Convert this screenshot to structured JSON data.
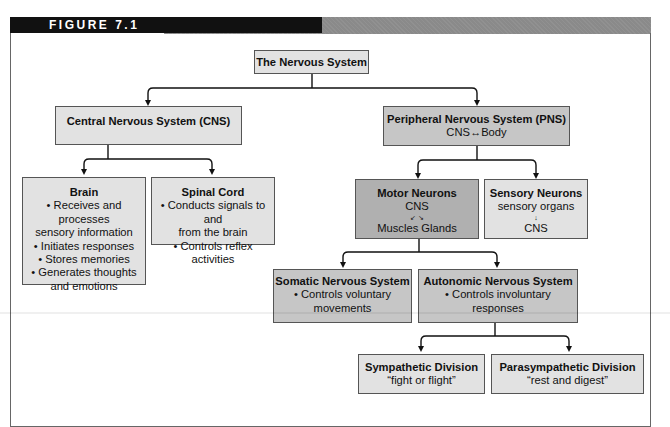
{
  "figure": {
    "label": "FIGURE 7.1"
  },
  "nodes": {
    "root": {
      "title": "The Nervous System"
    },
    "cns": {
      "title": "Central Nervous System (CNS)"
    },
    "pns": {
      "title": "Peripheral Nervous System (PNS)",
      "subtitle": "CNS↔Body"
    },
    "brain": {
      "title": "Brain",
      "lines": [
        "• Receives and processes",
        "sensory information",
        "• Initiates responses",
        "• Stores memories",
        "• Generates thoughts",
        "and emotions"
      ]
    },
    "spinal": {
      "title": "Spinal Cord",
      "lines": [
        "• Conducts signals to and",
        "from the brain",
        "• Controls reflex activities"
      ]
    },
    "motor": {
      "title": "Motor Neurons",
      "lines": [
        "CNS",
        "↙ ↘",
        "Muscles Glands"
      ]
    },
    "sensory": {
      "title": "Sensory Neurons",
      "lines": [
        "sensory organs",
        "↓",
        "CNS"
      ]
    },
    "somatic": {
      "title": "Somatic Nervous System",
      "lines": [
        "• Controls voluntary",
        "movements"
      ]
    },
    "autonomic": {
      "title": "Autonomic Nervous System",
      "lines": [
        "• Controls involuntary responses"
      ]
    },
    "sympathetic": {
      "title": "Sympathetic Division",
      "lines": [
        "“fight or flight”"
      ]
    },
    "parasympathetic": {
      "title": "Parasympathetic Division",
      "lines": [
        "“rest and digest”"
      ]
    }
  },
  "colors": {
    "header_black": "#111111",
    "header_gray": "#8a8a8a",
    "box_light": "#e2e2e2",
    "box_mid": "#c6c6c6",
    "box_dark": "#b0b0b0"
  }
}
